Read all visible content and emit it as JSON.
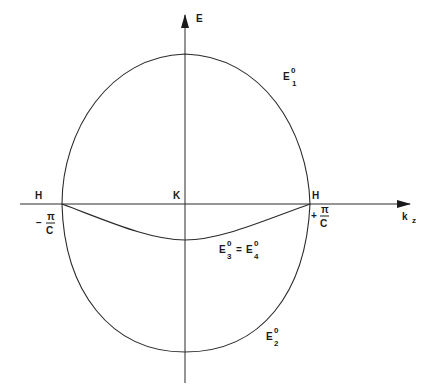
{
  "diagram": {
    "type": "band-structure-sketch",
    "axes": {
      "vertical_label": "E",
      "horizontal_label_main": "k",
      "horizontal_label_sub": "z"
    },
    "points": {
      "center": "K",
      "left_edge": "H",
      "right_edge": "H"
    },
    "boundaries": {
      "left": {
        "sign": "−",
        "numerator": "π",
        "denominator": "C"
      },
      "right": {
        "sign": "+",
        "numerator": "π",
        "denominator": "C"
      }
    },
    "bands": [
      {
        "id": "E1",
        "base": "E",
        "sup": "0",
        "sub": "1",
        "description": "upper band"
      },
      {
        "id": "E2",
        "base": "E",
        "sup": "0",
        "sub": "2",
        "description": "lower band"
      },
      {
        "id": "E34",
        "base": "E",
        "sup": "0",
        "sub": "3",
        "equals": "=",
        "base2": "E",
        "sup2": "0",
        "sub2": "4",
        "description": "degenerate middle band"
      }
    ]
  }
}
